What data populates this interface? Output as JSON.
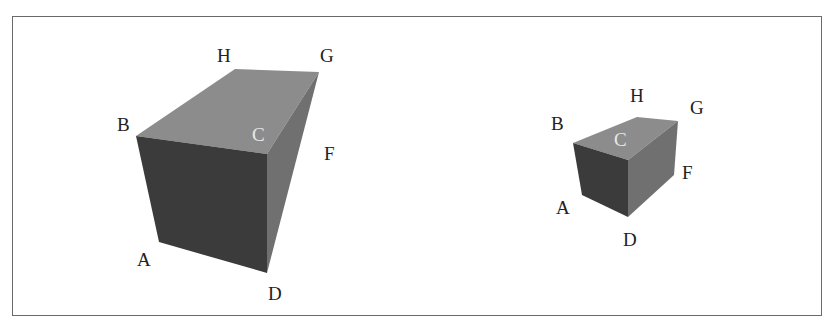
{
  "figure": {
    "colors": {
      "front_face": "#3b3b3b",
      "top_face": "#8c8c8c",
      "side_face": "#707070",
      "label": "#222222",
      "label_on_face": "#e8e8e8",
      "frame": "#6a6a6a"
    },
    "boxes": [
      {
        "name": "large-box",
        "labels": {
          "A": "A",
          "B": "B",
          "C": "C",
          "D": "D",
          "F": "F",
          "G": "G",
          "H": "H"
        }
      },
      {
        "name": "small-box",
        "labels": {
          "A": "A",
          "B": "B",
          "C": "C",
          "D": "D",
          "F": "F",
          "G": "G",
          "H": "H"
        }
      }
    ]
  }
}
